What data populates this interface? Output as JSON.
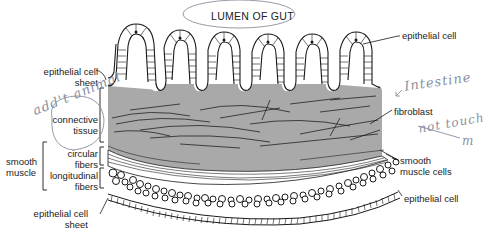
{
  "diagram": {
    "title": "LUMEN OF GUT",
    "colors": {
      "connective_tissue": "#a9a9a9",
      "line": "#1a1a1a",
      "pencil": "#8a8fa0",
      "background": "#ffffff"
    },
    "labels": {
      "epithelial_cell_top": "epithelial cell",
      "epithelial_cell_sheet_top_1": "epithelial cell",
      "epithelial_cell_sheet_top_2": "sheet",
      "connective_tissue_1": "connective",
      "connective_tissue_2": "tissue",
      "fibroblast": "fibroblast",
      "smooth_muscle_1": "smooth",
      "smooth_muscle_2": "muscle",
      "circular_fibers_1": "circular",
      "circular_fibers_2": "fibers",
      "longitudinal_fibers_1": "longitudinal",
      "longitudinal_fibers_2": "fibers",
      "smooth_muscle_cells_1": "smooth",
      "smooth_muscle_cells_2": "muscle cells",
      "epithelial_cell_bottom_right": "epithelial cell",
      "epithelial_cell_sheet_bottom_1": "epithelial cell",
      "epithelial_cell_sheet_bottom_2": "sheet"
    },
    "handwritten_annotations": {
      "left": "add't animal",
      "right_top": "Intestine",
      "right_bottom": "not touch",
      "right_bottom_trailing": "m"
    }
  }
}
